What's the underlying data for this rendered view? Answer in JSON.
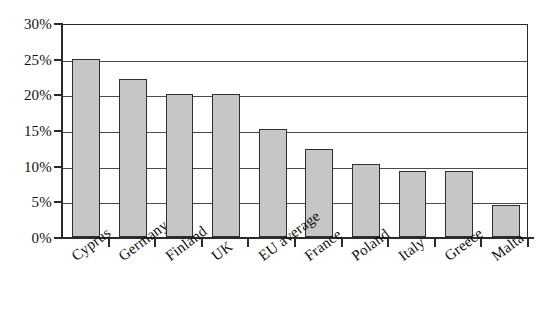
{
  "chart_data": {
    "type": "bar",
    "title": "",
    "subtitle": "",
    "xlabel": "",
    "ylabel": "",
    "categories": [
      "Cyprus",
      "Germany",
      "Finland",
      "UK",
      "EU average",
      "France",
      "Poland",
      "Italy",
      "Greece",
      "Malta"
    ],
    "values": [
      25.0,
      22.1,
      20.1,
      20.1,
      15.1,
      12.3,
      10.2,
      9.2,
      9.3,
      4.5
    ],
    "value_labels": [
      "25%",
      "22.1%",
      "20.1%",
      "20.1%",
      "15.1%",
      "12.3%",
      "10.2%",
      "9.2%",
      "9.3%",
      "4.5%"
    ],
    "ylim": [
      0,
      30
    ],
    "ytick_values": [
      0,
      5,
      10,
      15,
      20,
      25,
      30
    ],
    "ytick_labels": [
      "0%",
      "5%",
      "10%",
      "15%",
      "20%",
      "25%",
      "30%"
    ],
    "grid": true,
    "grid_axis": "y",
    "legend": false,
    "legend_position": "none",
    "annotations": []
  },
  "style": {
    "bar_fill": "#c6c6c6",
    "bar_stroke": "#2f2f2f",
    "axis_color": "#2b2b2b",
    "grid_color": "#4a4a4a",
    "text_color": "#111111",
    "background": "#ffffff"
  }
}
